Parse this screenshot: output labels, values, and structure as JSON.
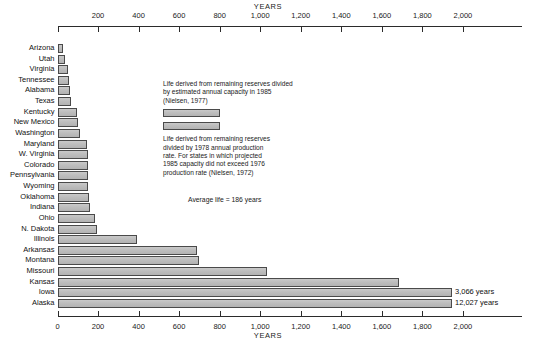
{
  "chart_data": {
    "type": "bar",
    "orientation": "horizontal",
    "title": "YEARS",
    "xlabel": "YEARS",
    "ylabel": "",
    "xlim": [
      0,
      2100
    ],
    "grid": false,
    "axis_top_label": "YEARS",
    "axis_bottom_label": "YEARS",
    "tick_labels": [
      "0",
      "200",
      "400",
      "600",
      "800",
      "1,000",
      "1,200",
      "1,400",
      "1,600",
      "1,800",
      "2,000"
    ],
    "tick_values": [
      0,
      200,
      400,
      600,
      800,
      1000,
      1200,
      1400,
      1600,
      1800,
      2000
    ],
    "categories": [
      "Arizona",
      "Utah",
      "Virginia",
      "Tennessee",
      "Alabama",
      "Texas",
      "Kentucky",
      "New Mexico",
      "Washington",
      "Maryland",
      "W. Virginia",
      "Colorado",
      "Pennsylvania",
      "Wyoming",
      "Oklahoma",
      "Indiana",
      "Ohio",
      "N. Dakota",
      "Illinois",
      "Arkansas",
      "Montana",
      "Missouri",
      "Kansas",
      "Iowa",
      "Alaska"
    ],
    "values": [
      25,
      35,
      50,
      55,
      60,
      65,
      95,
      100,
      110,
      145,
      150,
      150,
      150,
      150,
      155,
      160,
      185,
      195,
      390,
      690,
      700,
      1035,
      1685,
      3066,
      12027
    ],
    "value_labels": [
      "",
      "",
      "",
      "",
      "",
      "",
      "",
      "",
      "",
      "",
      "",
      "",
      "",
      "",
      "",
      "",
      "",
      "",
      "",
      "",
      "",
      "",
      "",
      "3,066 years",
      "12,027 years"
    ],
    "annotations": [
      "Life derived from remaining reserves divided by estimated annual capacity in 1985 (Nielsen, 1977)",
      "Life derived from remaining reserves divided by 1978 annual production rate. For states in which projected 1985 capacity did not exceed 1976 production rate (Nielsen, 1972)",
      "Average life = 186 years"
    ],
    "bar_color": "#bdbdbd",
    "bar_edge_color": "#4a4a4a"
  },
  "legend": {
    "entry1_text": "Life derived from remaining reserves divided\nby estimated annual capacity in 1985\n(Nielsen, 1977)",
    "entry2_text": "Life derived from remaining reserves\ndivided by 1978 annual production\nrate. For states in which projected\n1985 capacity did not exceed 1976\nproduction rate (Nielsen, 1972)",
    "swatch1_name": "1985-capacity-swatch",
    "swatch2_name": "1978-production-swatch"
  },
  "notes": {
    "average_life": "Average life = 186 years"
  }
}
